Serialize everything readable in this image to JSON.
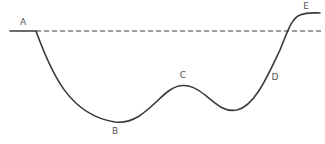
{
  "diagram": {
    "type": "profile-curve",
    "reference_line": "dashed horizontal baseline at level of point A",
    "colors": {
      "curve": "#3a3a3a",
      "dashed": "#3a3a3a",
      "label": "#555555",
      "background": "#ffffff"
    },
    "points": [
      {
        "id": "A",
        "label": "A",
        "x": 23,
        "y": 25
      },
      {
        "id": "B",
        "label": "B",
        "x": 115,
        "y": 134
      },
      {
        "id": "C",
        "label": "C",
        "x": 183,
        "y": 78
      },
      {
        "id": "D",
        "label": "D",
        "x": 275,
        "y": 80
      },
      {
        "id": "E",
        "label": "E",
        "x": 306,
        "y": 9
      }
    ]
  }
}
